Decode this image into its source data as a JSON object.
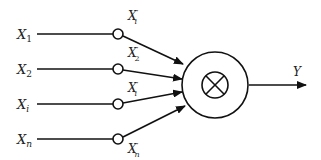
{
  "diagram": {
    "title": "",
    "inputs": [
      {
        "label": "X",
        "sub": "1",
        "weighted_label": "X",
        "weighted_sub": "i",
        "prime": "′",
        "y": 34,
        "label_y": 14,
        "label_above": true
      },
      {
        "label": "X",
        "sub": "2",
        "weighted_label": "X",
        "weighted_sub": "2",
        "prime": "′",
        "y": 69,
        "label_y": 51,
        "label_above": true
      },
      {
        "label": "X",
        "sub": "i",
        "weighted_label": "X",
        "weighted_sub": "i",
        "prime": "′",
        "y": 104,
        "label_y": 86,
        "label_above": true
      },
      {
        "label": "X",
        "sub": "n",
        "weighted_label": "X",
        "weighted_sub": "n",
        "prime": "′",
        "y": 139,
        "label_y": 156,
        "label_above": false
      }
    ],
    "node": {
      "symbol": "⊗",
      "description": "multiplication node"
    },
    "output": {
      "label": "Y"
    },
    "colors": {
      "stroke": "#111111",
      "background": "#ffffff"
    }
  }
}
